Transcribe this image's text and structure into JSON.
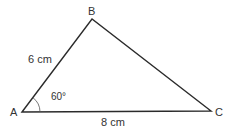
{
  "diagram": {
    "type": "triangle",
    "vertices": {
      "A": {
        "label": "A",
        "x": 22,
        "y": 112
      },
      "B": {
        "label": "B",
        "x": 92,
        "y": 19
      },
      "C": {
        "label": "C",
        "x": 211,
        "y": 111
      }
    },
    "side_AB": {
      "label": "6 cm",
      "length": 6,
      "unit": "cm"
    },
    "side_AC": {
      "label": "8 cm",
      "length": 8,
      "unit": "cm"
    },
    "angle_A": {
      "label": "60°",
      "degrees": 60
    },
    "stroke_color": "#2b2b2b"
  }
}
